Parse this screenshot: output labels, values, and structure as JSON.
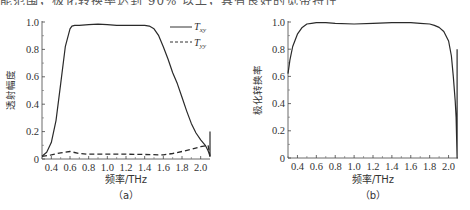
{
  "page": {
    "top_text": "能范围，极化转换率达到 90% 以上，具有良好的宽带特性"
  },
  "chart_data": [
    {
      "type": "line",
      "panel_label": "（a）",
      "title": "",
      "xlabel": "频率/THz",
      "ylabel": "透射幅度",
      "xlim": [
        0.3,
        2.1
      ],
      "ylim": [
        0,
        1.0
      ],
      "xticks": [
        "0.4",
        "0.6",
        "0.8",
        "1.0",
        "1.2",
        "1.4",
        "1.6",
        "1.8",
        "2.0"
      ],
      "yticks": [
        "0",
        "0.2",
        "0.4",
        "0.6",
        "0.8",
        "1.0"
      ],
      "grid": false,
      "legend_position": "upper right",
      "series": [
        {
          "name": "T_xy",
          "legend_main": "T",
          "legend_sub": "xy",
          "style": "solid",
          "x": [
            0.3,
            0.35,
            0.4,
            0.45,
            0.5,
            0.55,
            0.6,
            0.62,
            0.65,
            0.7,
            0.8,
            0.9,
            1.0,
            1.1,
            1.2,
            1.3,
            1.4,
            1.45,
            1.5,
            1.55,
            1.6,
            1.65,
            1.7,
            1.75,
            1.8,
            1.85,
            1.9,
            1.95,
            2.0,
            2.05,
            2.08,
            2.09,
            2.1,
            2.1
          ],
          "y": [
            0.02,
            0.05,
            0.12,
            0.28,
            0.55,
            0.82,
            0.95,
            0.97,
            0.975,
            0.975,
            0.98,
            0.985,
            0.98,
            0.975,
            0.975,
            0.975,
            0.975,
            0.97,
            0.95,
            0.9,
            0.82,
            0.73,
            0.63,
            0.55,
            0.45,
            0.35,
            0.26,
            0.19,
            0.14,
            0.1,
            0.06,
            0.04,
            0.02,
            0.2
          ]
        },
        {
          "name": "T_yy",
          "legend_main": "T",
          "legend_sub": "yy",
          "style": "dashed",
          "x": [
            0.3,
            0.4,
            0.5,
            0.6,
            0.7,
            0.8,
            1.0,
            1.2,
            1.4,
            1.6,
            1.7,
            1.8,
            1.9,
            2.0,
            2.08,
            2.1
          ],
          "y": [
            0.02,
            0.03,
            0.045,
            0.055,
            0.04,
            0.035,
            0.035,
            0.035,
            0.033,
            0.03,
            0.04,
            0.055,
            0.07,
            0.09,
            0.1,
            0.02
          ]
        }
      ]
    },
    {
      "type": "line",
      "panel_label": "（b）",
      "title": "",
      "xlabel": "频率/THz",
      "ylabel": "极化转换率",
      "xlim": [
        0.3,
        2.1
      ],
      "ylim": [
        0,
        1.0
      ],
      "xticks": [
        "0.4",
        "0.6",
        "0.8",
        "1.0",
        "1.2",
        "1.4",
        "1.6",
        "1.8",
        "2.0"
      ],
      "yticks": [
        "0",
        "0.2",
        "0.4",
        "0.6",
        "0.8",
        "1.0"
      ],
      "grid": false,
      "series": [
        {
          "name": "PCR",
          "style": "solid",
          "x": [
            0.3,
            0.32,
            0.35,
            0.4,
            0.45,
            0.5,
            0.55,
            0.6,
            0.7,
            0.8,
            1.0,
            1.2,
            1.4,
            1.6,
            1.7,
            1.8,
            1.85,
            1.9,
            1.95,
            2.0,
            2.03,
            2.05,
            2.07,
            2.08,
            2.09,
            2.09
          ],
          "y": [
            0.62,
            0.72,
            0.82,
            0.91,
            0.96,
            0.985,
            0.99,
            0.995,
            0.995,
            0.99,
            0.985,
            0.99,
            0.995,
            0.995,
            0.99,
            0.985,
            0.975,
            0.96,
            0.93,
            0.86,
            0.75,
            0.6,
            0.42,
            0.3,
            0.0,
            0.8
          ]
        }
      ]
    }
  ]
}
